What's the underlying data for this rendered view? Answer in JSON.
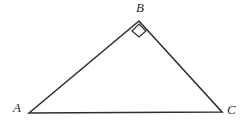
{
  "figure": {
    "name": "right-triangle-abc",
    "background_color": "#ffffff",
    "stroke_color": "#2f2f2f",
    "stroke_width": 1.6,
    "label_color": "#2b2b2b",
    "canvas": {
      "width": 246,
      "height": 127
    }
  },
  "vertices": {
    "A": {
      "label": "A",
      "x": 29,
      "y": 113,
      "label_x": 13,
      "label_y": 101
    },
    "B": {
      "label": "B",
      "x": 139,
      "y": 21,
      "label_x": 136,
      "label_y": 1
    },
    "C": {
      "label": "C",
      "x": 222,
      "y": 112,
      "label_x": 227,
      "label_y": 103
    }
  },
  "edges": [
    {
      "name": "side-AB",
      "from": "A",
      "to": "B"
    },
    {
      "name": "side-BC",
      "from": "B",
      "to": "C"
    },
    {
      "name": "side-AC",
      "from": "A",
      "to": "C"
    }
  ],
  "angle_markers": [
    {
      "name": "right-angle-marker-b",
      "at_vertex": "B",
      "type": "square",
      "measure": "90",
      "points": "139,24 146,31 139,37 132,31"
    }
  ],
  "polygon_points": "29,113 139,21 222,112"
}
